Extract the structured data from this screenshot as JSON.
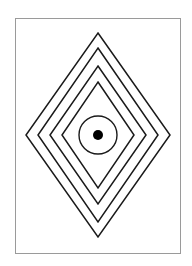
{
  "figure": {
    "background": "#ffffff",
    "stroke_color": "#1a1a1a",
    "frame": {
      "x": 15,
      "y": 18,
      "width": 165,
      "height": 235,
      "color": "#9a9a9a"
    },
    "center": {
      "x": 98,
      "y": 135
    },
    "diamonds": [
      {
        "name": "diamond-1",
        "half_width": 72,
        "half_height": 102
      },
      {
        "name": "diamond-2",
        "half_width": 60,
        "half_height": 87
      },
      {
        "name": "diamond-3",
        "half_width": 48,
        "half_height": 69
      },
      {
        "name": "diamond-4",
        "half_width": 36,
        "half_height": 53
      }
    ],
    "circle": {
      "radius": 19
    },
    "dot": {
      "radius": 5
    }
  }
}
